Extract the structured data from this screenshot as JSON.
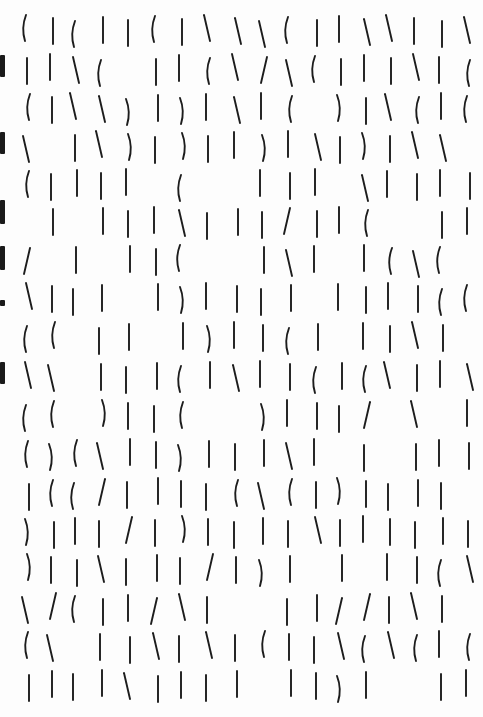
{
  "page": {
    "title": "",
    "background": "#fdfdfd",
    "ink_color": "#1c1c1c"
  },
  "grid": {
    "columns_x": [
      27,
      52,
      75,
      101,
      128,
      156,
      181,
      208,
      236,
      262,
      289,
      316,
      340,
      365,
      389,
      416,
      441,
      468
    ],
    "rows_y": [
      18,
      57,
      96,
      134,
      172,
      210,
      248,
      286,
      325,
      364,
      403,
      442,
      481,
      519,
      557,
      596,
      634,
      673
    ],
    "stroke_height": 26,
    "legend": {
      "|": "straight",
      "(": "curve-left",
      ")": "curve-right",
      "/": "slash",
      "\\": "backslash",
      ".": "empty"
    },
    "rows": [
      "(|(||(|\\\\\\(||\\\\||\\",
      "||\\(.||(\\/\\(|||\\|(",
      "(|\\\\)|)|\\|(.)|\\(|(",
      "\\.|\\)|)||)|\\|)|\\\\.",
      "(||||.(..|||.\\||||",
      ".|.|||\\|||/||(..||",
      "/.|.||(..|\\|.|(\\(.",
      "\\|||.|)||||.||||((",
      "((.||.|)||(|.||\\|.(",
      "\\\\.|||(|\\||(|(\\||\\",
      "((.)||(..)|||/.\\.||",
      "()(\\||)|||\\|.|.|||",
      "|((/||||(\\(|)||||.",
      ")|||/|)||||\\||||||",
      ")||\\|||/|)|.|.||(\\",
      "\\/(||/\\|..||//|\\|.",
      "(\\.||\\|\\|(||\\(\\(|(",
      "||||\\||||.||)|..||("
    ]
  },
  "edge_marks": [
    {
      "y": 55,
      "h": 22
    },
    {
      "y": 132,
      "h": 22
    },
    {
      "y": 200,
      "h": 24
    },
    {
      "y": 246,
      "h": 24
    },
    {
      "y": 300,
      "h": 6
    },
    {
      "y": 362,
      "h": 22
    }
  ]
}
